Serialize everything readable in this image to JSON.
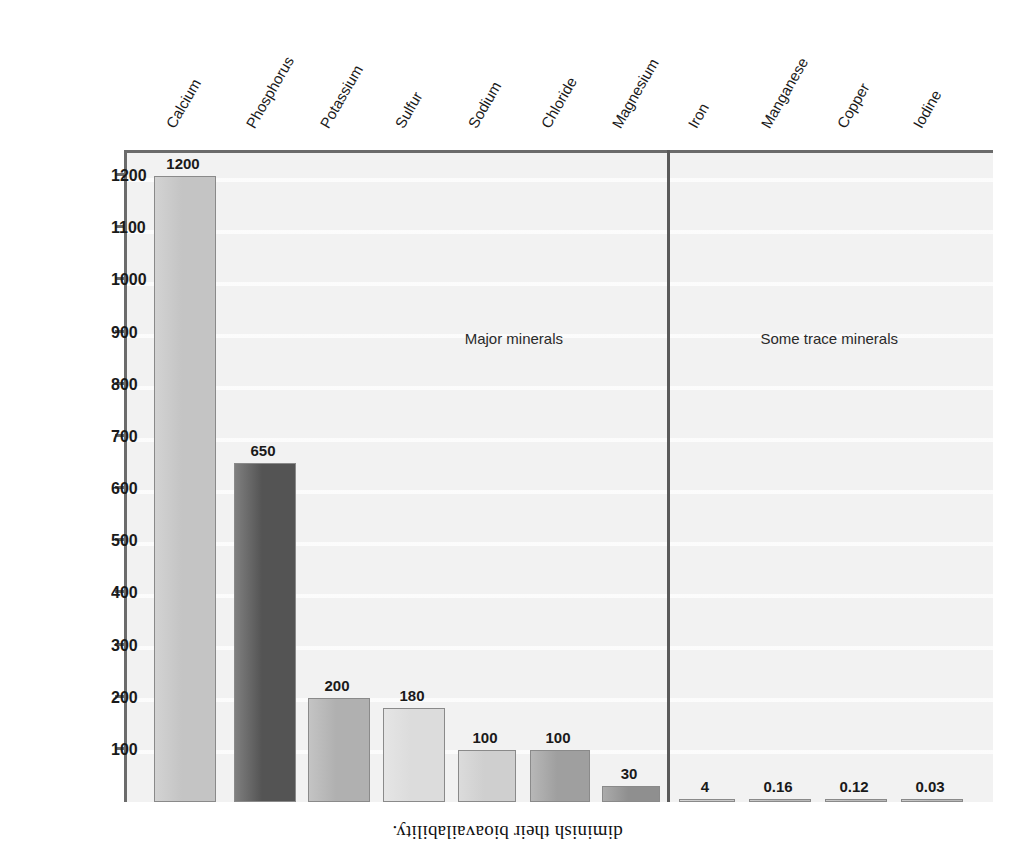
{
  "caption": {
    "text": "diminish their bioavailability."
  },
  "chart_data": {
    "type": "bar",
    "title": "",
    "xlabel": "",
    "ylabel": "Grams in human body",
    "ylim": [
      0,
      1250
    ],
    "grid": false,
    "legend": "none",
    "orientation": "vertical",
    "note": "Figure is printed upside-down (rotated 180 degrees) in the scan.",
    "groups": [
      {
        "name": "Some trace minerals",
        "categories": [
          "Iodine",
          "Copper",
          "Manganese",
          "Iron"
        ]
      },
      {
        "name": "Major minerals",
        "categories": [
          "Magnesium",
          "Chloride",
          "Sodium",
          "Sulfur",
          "Potassium",
          "Phosphorus",
          "Calcium"
        ]
      }
    ],
    "categories": [
      "Iodine",
      "Copper",
      "Manganese",
      "Iron",
      "Magnesium",
      "Chloride",
      "Sodium",
      "Sulfur",
      "Potassium",
      "Phosphorus",
      "Calcium"
    ],
    "values": [
      0.03,
      0.12,
      0.16,
      4,
      30,
      100,
      100,
      180,
      200,
      650,
      1200
    ],
    "value_labels": [
      "0.03",
      "0.12",
      "0.16",
      "4",
      "30",
      "100",
      "100",
      "180",
      "200",
      "650",
      "1200"
    ],
    "bar_colors": [
      "#b9b9b9",
      "#b9b9b9",
      "#b9b9b9",
      "#c9c9c9",
      "#8f8f8f",
      "#9f9f9f",
      "#cfcfcf",
      "#dcdcdc",
      "#b0b0b0",
      "#545454",
      "#c4c4c4"
    ],
    "yticks": [
      100,
      200,
      300,
      400,
      500,
      600,
      700,
      800,
      900,
      1000,
      1100,
      1200
    ],
    "ytick_labels": [
      "100",
      "200",
      "300",
      "400",
      "500",
      "600",
      "700",
      "800",
      "900",
      "1000",
      "1100",
      "1200"
    ]
  },
  "colors": {
    "panel": "#f2f2f2",
    "axis": "#6b6b6b",
    "divider": "#5a5a5a",
    "text": "#1a1a1a",
    "dark_bar": "#545454",
    "light_bar": "#dcdcdc"
  }
}
